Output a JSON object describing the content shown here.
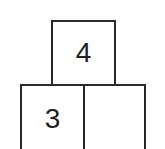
{
  "diagram": {
    "type": "number pyramid",
    "top_row": [
      {
        "value": "4"
      }
    ],
    "bottom_row": [
      {
        "value": "3"
      },
      {
        "value": ""
      }
    ]
  }
}
